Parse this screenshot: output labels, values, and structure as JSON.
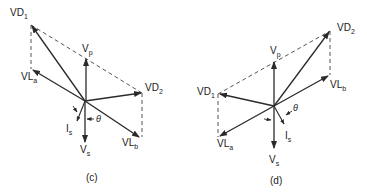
{
  "diagrams": [
    {
      "id": "c",
      "caption": "(c)",
      "labels": {
        "vd1": {
          "main": "VD",
          "sub": "1"
        },
        "vp": {
          "main": "V",
          "sub": "p"
        },
        "vla": {
          "main": "VL",
          "sub": "a"
        },
        "vd2": {
          "main": "VD",
          "sub": "2"
        },
        "vlb": {
          "main": "VL",
          "sub": "b"
        },
        "vs": {
          "main": "V",
          "sub": "s"
        },
        "is": {
          "main": "I",
          "sub": "s"
        },
        "theta": "θ"
      }
    },
    {
      "id": "d",
      "caption": "(d)",
      "labels": {
        "vd1": {
          "main": "VD",
          "sub": "1"
        },
        "vp": {
          "main": "V",
          "sub": "p"
        },
        "vla": {
          "main": "VL",
          "sub": "a"
        },
        "vd2": {
          "main": "VD",
          "sub": "2"
        },
        "vlb": {
          "main": "VL",
          "sub": "b"
        },
        "vs": {
          "main": "V",
          "sub": "s"
        },
        "is": {
          "main": "I",
          "sub": "s"
        },
        "theta": "θ"
      }
    }
  ],
  "colors": {
    "line": "#2a2a2a",
    "background": "#ffffff"
  }
}
